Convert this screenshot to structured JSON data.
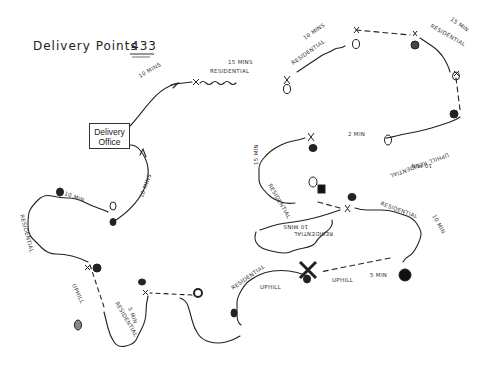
{
  "title": {
    "text": "Delivery Points",
    "number": "433"
  },
  "office": {
    "line1": "Delivery",
    "line2": "Office"
  },
  "route_labels": {
    "out_leg": "10 MINS",
    "return_leg": "10 MINS",
    "seg1_time": "15 MINS",
    "seg1_type": "RESIDENTIAL",
    "seg2_time": "10 MINS",
    "seg2_type": "RESIDENTIAL",
    "seg3_time": "15 MIN",
    "seg3_type": "RESIDENTIAL",
    "seg4_type": "UPHILL RESIDENTIAL",
    "seg4_time": "10 MIN",
    "seg5_time": "2 MIN",
    "seg6_time": "15 MIN",
    "seg6_type": "RESIDENTIAL",
    "seg7_type": "RESIDENTIAL",
    "seg7_time": "10 MINS",
    "seg8_type": "RESIDENTIAL",
    "seg8_time": "10 MIN",
    "seg9_type": "UPHILL",
    "seg9_time": "5 MIN",
    "seg10_type": "RESIDENTIAL",
    "seg10_sub": "UPHILL",
    "seg11_type": "RESIDENTIAL",
    "seg11_time": "5 MIN",
    "seg12_type": "UPHILL",
    "seg13_type": "RESIDENTIAL",
    "seg14_time": "10 MIN"
  },
  "colors": {
    "ink": "#222222",
    "paper": "#ffffff"
  }
}
